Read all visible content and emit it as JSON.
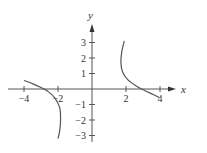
{
  "chart_data": {
    "type": "line",
    "title": "",
    "xlabel": "x",
    "ylabel": "y",
    "xlim": [
      -4.6,
      4.8
    ],
    "ylim": [
      -3.4,
      3.9
    ],
    "grid": false,
    "x_ticks": [
      -4,
      -2,
      2,
      4
    ],
    "x_tick_labels": [
      "−4",
      "−2",
      "2",
      "4"
    ],
    "y_ticks": [
      3,
      2,
      1,
      -1,
      -2,
      -3
    ],
    "y_tick_labels": [
      "3",
      "2",
      "1",
      "−1",
      "−2",
      "−3"
    ],
    "series": [
      {
        "name": "left branch",
        "points": [
          [
            -4,
            0.55
          ],
          [
            -3.5,
            0.35
          ],
          [
            -3,
            0.1
          ],
          [
            -2.6,
            -0.15
          ],
          [
            -2.2,
            -0.55
          ],
          [
            -1.9,
            -1.2
          ],
          [
            -1.85,
            -2.0
          ],
          [
            -1.9,
            -2.7
          ],
          [
            -2.0,
            -3.2
          ]
        ]
      },
      {
        "name": "right branch",
        "points": [
          [
            1.9,
            3.1
          ],
          [
            1.75,
            2.4
          ],
          [
            1.7,
            1.7
          ],
          [
            1.8,
            1.1
          ],
          [
            2.1,
            0.6
          ],
          [
            2.6,
            0.2
          ],
          [
            3.1,
            -0.1
          ],
          [
            3.6,
            -0.35
          ],
          [
            3.95,
            -0.55
          ]
        ]
      }
    ]
  },
  "axes": {
    "x_label": "x",
    "y_label": "y"
  }
}
